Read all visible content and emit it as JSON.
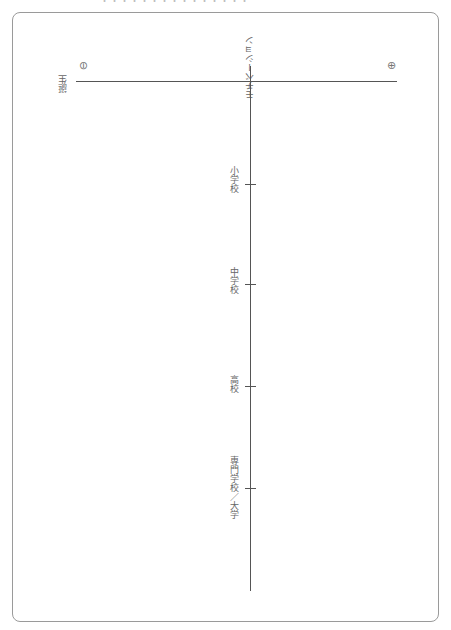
{
  "header": {
    "cut_text": "・・・・・・・・・・・・・・・"
  },
  "chart": {
    "axis_title": "モチベーション",
    "minus_symbol": "⊖",
    "plus_symbol": "⊕",
    "start_label": "誕生",
    "milestones": [
      {
        "label": "小学校",
        "y": 184
      },
      {
        "label": "中学校",
        "y": 284
      },
      {
        "label": "高校",
        "y": 386
      },
      {
        "label": "専門学校／大学",
        "y": 488
      }
    ]
  },
  "colors": {
    "line": "#555555",
    "border": "#9a9a9a",
    "text": "#666666"
  }
}
